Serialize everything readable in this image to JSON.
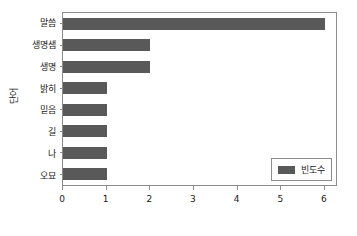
{
  "chart_data": {
    "type": "bar",
    "orientation": "horizontal",
    "title": "",
    "xlabel": "",
    "ylabel": "단어",
    "categories": [
      "말씀",
      "생명샘",
      "생명",
      "밝히",
      "믿음",
      "길",
      "나",
      "오묘"
    ],
    "values": [
      6,
      2,
      2,
      1,
      1,
      1,
      1,
      1
    ],
    "series": [
      {
        "name": "빈도수",
        "values": [
          6,
          2,
          2,
          1,
          1,
          1,
          1,
          1
        ],
        "color": "#595959"
      }
    ],
    "xlim": [
      0,
      6.3
    ],
    "x_ticks": [
      0,
      1,
      2,
      3,
      4,
      5,
      6
    ],
    "x_tick_labels": [
      "0",
      "1",
      "2",
      "3",
      "4",
      "5",
      "6"
    ],
    "grid": false,
    "legend": {
      "entries": [
        "빈도수"
      ],
      "position": "lower right"
    }
  },
  "colors": {
    "bar": "#595959",
    "axis": "#8c8c8c",
    "text": "#1a1a1a",
    "background": "#ffffff"
  }
}
